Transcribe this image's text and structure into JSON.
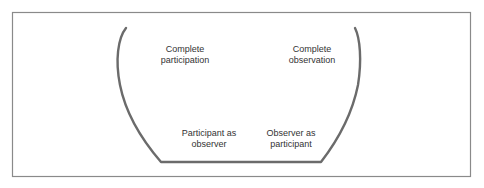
{
  "diagram": {
    "colors": {
      "frame": "#8a8a8a",
      "curve": "#6b6b6b",
      "text": "#333333",
      "background": "#ffffff"
    },
    "roles": [
      {
        "id": "complete-participation",
        "line1": "Complete",
        "line2": "participation"
      },
      {
        "id": "participant-as-observer",
        "line1": "Participant as",
        "line2": "observer"
      },
      {
        "id": "observer-as-participant",
        "line1": "Observer as",
        "line2": "participant"
      },
      {
        "id": "complete-observation",
        "line1": "Complete",
        "line2": "observation"
      }
    ]
  }
}
